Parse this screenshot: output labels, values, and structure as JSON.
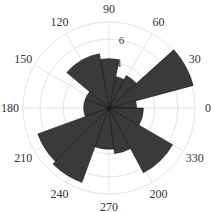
{
  "chart_data": {
    "type": "polar-bar",
    "title": "",
    "theta_unit": "degrees",
    "theta_tick_labels": [
      "0",
      "30",
      "60",
      "90",
      "120",
      "150",
      "180",
      "210",
      "240",
      "270",
      "200",
      "330"
    ],
    "theta_tick_angles": [
      0,
      30,
      60,
      90,
      120,
      150,
      180,
      210,
      240,
      270,
      300,
      330
    ],
    "r_tick_labels": [
      "2",
      "4",
      "6"
    ],
    "r_ticks": [
      2,
      4,
      6
    ],
    "rlim": [
      0,
      7.5
    ],
    "grid": true,
    "bar_color": "#3a3a3a",
    "edge_color": "#111111",
    "bins": [
      {
        "start": 0,
        "end": 15,
        "value": 2.4
      },
      {
        "start": 15,
        "end": 42,
        "value": 7.6
      },
      {
        "start": 42,
        "end": 62,
        "value": 3.2
      },
      {
        "start": 62,
        "end": 78,
        "value": 2.8
      },
      {
        "start": 78,
        "end": 100,
        "value": 4.3
      },
      {
        "start": 100,
        "end": 140,
        "value": 4.8
      },
      {
        "start": 140,
        "end": 160,
        "value": 2.2
      },
      {
        "start": 160,
        "end": 200,
        "value": 2.2
      },
      {
        "start": 200,
        "end": 225,
        "value": 6.6
      },
      {
        "start": 225,
        "end": 250,
        "value": 6.9
      },
      {
        "start": 250,
        "end": 277,
        "value": 3.6
      },
      {
        "start": 277,
        "end": 298,
        "value": 4.0
      },
      {
        "start": 298,
        "end": 330,
        "value": 6.4
      },
      {
        "start": 330,
        "end": 360,
        "value": 3.0
      }
    ]
  }
}
